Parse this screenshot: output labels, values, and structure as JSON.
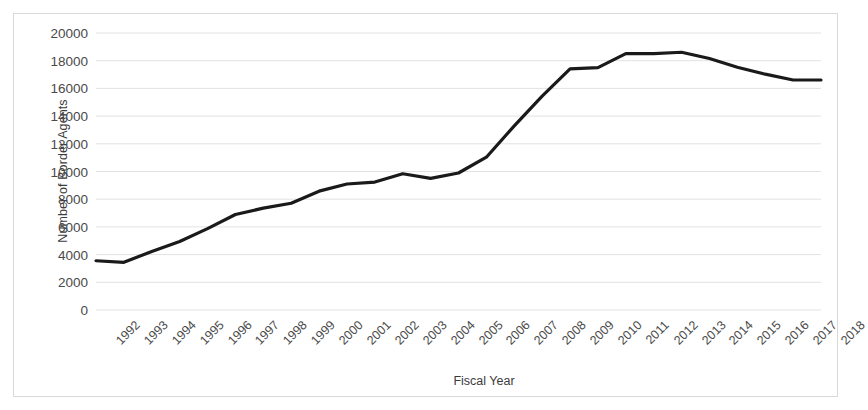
{
  "chart_data": {
    "type": "line",
    "title": "",
    "xlabel": "Fiscal Year",
    "ylabel": "Number of Border Agents",
    "categories": [
      "1992",
      "1993",
      "1994",
      "1995",
      "1996",
      "1997",
      "1998",
      "1999",
      "2000",
      "2001",
      "2002",
      "2003",
      "2004",
      "2005",
      "2006",
      "2007",
      "2008",
      "2009",
      "2010",
      "2011",
      "2012",
      "2013",
      "2014",
      "2015",
      "2016",
      "2017",
      "2018"
    ],
    "values": [
      3555,
      3444,
      4226,
      4945,
      5878,
      6895,
      7357,
      7706,
      8580,
      9096,
      9239,
      9840,
      9506,
      9891,
      11032,
      13297,
      15442,
      17408,
      17499,
      18506,
      18516,
      18611,
      18156,
      17522,
      17026,
      16605,
      16605
    ],
    "ylim": [
      0,
      20000
    ],
    "ytick_values": [
      0,
      2000,
      4000,
      6000,
      8000,
      10000,
      12000,
      14000,
      16000,
      18000,
      20000
    ],
    "ytick_labels": [
      "0",
      "2000",
      "4000",
      "6000",
      "8000",
      "10000",
      "12000",
      "14000",
      "16000",
      "18000",
      "20000"
    ],
    "grid": true,
    "grid_axis": "y",
    "legend": "none",
    "series": [
      {
        "name": "Number of Border Agents",
        "color": "#1a1a1a",
        "line_width": 3.2,
        "values": [
          3555,
          3444,
          4226,
          4945,
          5878,
          6895,
          7357,
          7706,
          8580,
          9096,
          9239,
          9840,
          9506,
          9891,
          11032,
          13297,
          15442,
          17408,
          17499,
          18506,
          18516,
          18611,
          18156,
          17522,
          17026,
          16605,
          16605
        ]
      }
    ]
  },
  "style": {
    "plot_background": "#ffffff",
    "frame_border_color": "#d9d9d9",
    "gridline_color": "#e2e2e2",
    "tick_text_color": "#4a4a4a",
    "axis_title_color": "#3c3c3c",
    "line_color": "#1a1a1a"
  }
}
